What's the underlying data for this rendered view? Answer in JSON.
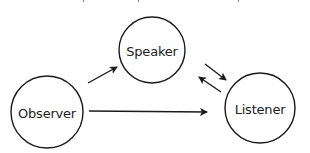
{
  "diagram": {
    "type": "communication-flow",
    "top_text_cut_off": true,
    "stroke_color": "#1a1a1a",
    "background": "#ffffff",
    "nodes": [
      {
        "id": "speaker",
        "label": "Speaker",
        "cx": 152,
        "cy": 50,
        "r": 33
      },
      {
        "id": "observer",
        "label": "Observer",
        "cx": 47,
        "cy": 112,
        "r": 36
      },
      {
        "id": "listener",
        "label": "Listener",
        "cx": 260,
        "cy": 108,
        "r": 35
      }
    ],
    "edges": [
      {
        "from": "observer",
        "to": "speaker",
        "x1": 88,
        "y1": 83,
        "x2": 117,
        "y2": 67
      },
      {
        "from": "speaker",
        "to": "listener",
        "x1": 205,
        "y1": 64,
        "x2": 226,
        "y2": 80
      },
      {
        "from": "listener",
        "to": "speaker",
        "x1": 221,
        "y1": 92,
        "x2": 199,
        "y2": 77
      },
      {
        "from": "observer",
        "to": "listener",
        "x1": 89,
        "y1": 111,
        "x2": 207,
        "y2": 112
      }
    ]
  }
}
